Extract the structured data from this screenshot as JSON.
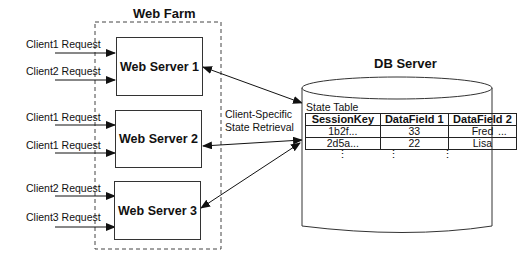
{
  "web_farm": {
    "title": "Web Farm",
    "servers": [
      {
        "label": "Web Server 1"
      },
      {
        "label": "Web Server 2"
      },
      {
        "label": "Web Server 3"
      }
    ],
    "requests": [
      {
        "label": "Client1 Request",
        "server": 1
      },
      {
        "label": "Client2 Request",
        "server": 1
      },
      {
        "label": "Client1 Request",
        "server": 2
      },
      {
        "label": "Client1 Request",
        "server": 2
      },
      {
        "label": "Client2 Request",
        "server": 3
      },
      {
        "label": "Client3 Request",
        "server": 3
      }
    ]
  },
  "connection": {
    "label_line1": "Client-Specific",
    "label_line2": "State Retrieval"
  },
  "db_server": {
    "title": "DB Server",
    "table_title": "State Table",
    "columns": [
      "SessionKey",
      "DataField 1",
      "DataField 2"
    ],
    "rows": [
      [
        "1b2f...",
        "33",
        "Fred"
      ],
      [
        "2d5a...",
        "22",
        "Lisa"
      ]
    ],
    "more_columns": "...",
    "more_rows": "⋮"
  }
}
